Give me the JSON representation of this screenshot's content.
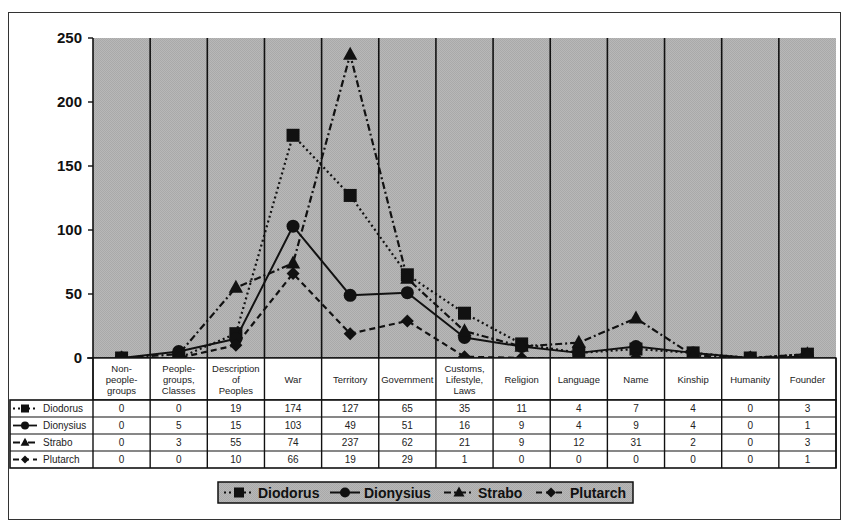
{
  "chart_data": {
    "type": "line",
    "title": "",
    "xlabel": "",
    "ylabel": "",
    "ylim": [
      0,
      250
    ],
    "yticks": [
      0,
      50,
      100,
      150,
      200,
      250
    ],
    "grid": "vertical category separators",
    "legend_position": "bottom",
    "data_table": true,
    "categories": [
      "Non-people-groups",
      "People-groups, Classes",
      "Description of Peoples",
      "War",
      "Territory",
      "Government",
      "Customs, Lifestyle, Laws",
      "Religion",
      "Language",
      "Name",
      "Kinship",
      "Humanity",
      "Founder"
    ],
    "category_label_lines": [
      [
        "Non-",
        "people-",
        "groups"
      ],
      [
        "People-",
        "groups,",
        "Classes"
      ],
      [
        "Description",
        "of",
        "Peoples"
      ],
      [
        "War"
      ],
      [
        "Territory"
      ],
      [
        "Government"
      ],
      [
        "Customs,",
        "Lifestyle,",
        "Laws"
      ],
      [
        "Religion"
      ],
      [
        "Language"
      ],
      [
        "Name"
      ],
      [
        "Kinship"
      ],
      [
        "Humanity"
      ],
      [
        "Founder"
      ]
    ],
    "series": [
      {
        "name": "Diodorus",
        "marker": "square",
        "dash": "2,3",
        "values": [
          0,
          0,
          19,
          174,
          127,
          65,
          35,
          11,
          4,
          7,
          4,
          0,
          3
        ]
      },
      {
        "name": "Dionysius",
        "marker": "circle",
        "dash": "",
        "values": [
          0,
          5,
          15,
          103,
          49,
          51,
          16,
          9,
          4,
          9,
          4,
          0,
          1
        ]
      },
      {
        "name": "Strabo",
        "marker": "triangle",
        "dash": "7,3,2,3",
        "values": [
          0,
          3,
          55,
          74,
          237,
          62,
          21,
          9,
          12,
          31,
          2,
          0,
          3
        ]
      },
      {
        "name": "Plutarch",
        "marker": "diamond",
        "dash": "6,4",
        "values": [
          0,
          0,
          10,
          66,
          19,
          29,
          1,
          0,
          0,
          0,
          0,
          0,
          1
        ]
      }
    ]
  },
  "colors": {
    "plot_background": "#b3b3b3",
    "legend_background": "#b3b3b3",
    "line": "#111111",
    "grid": "#111111"
  }
}
